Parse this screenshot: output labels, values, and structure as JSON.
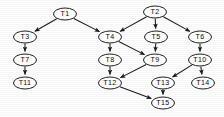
{
  "diagram": {
    "type": "directed-acyclic-graph",
    "background_color": "#fdfdfd",
    "node_fill_color": "#ffffff",
    "node_stroke_color": "#161616",
    "edge_color": "#1c1c1c",
    "label_color": "#0d0d0d",
    "node_shape": "ellipse",
    "node_rx": 11.5,
    "node_ry": 6.0,
    "nodes": [
      {
        "id": "T1",
        "label": "T1",
        "x": 65,
        "y": 14
      },
      {
        "id": "T2",
        "label": "T2",
        "x": 155,
        "y": 12
      },
      {
        "id": "T3",
        "label": "T3",
        "x": 25,
        "y": 37
      },
      {
        "id": "T4",
        "label": "T4",
        "x": 110,
        "y": 37
      },
      {
        "id": "T5",
        "label": "T5",
        "x": 156,
        "y": 37
      },
      {
        "id": "T6",
        "label": "T6",
        "x": 200,
        "y": 37
      },
      {
        "id": "T7",
        "label": "T7",
        "x": 25,
        "y": 60
      },
      {
        "id": "T8",
        "label": "T8",
        "x": 110,
        "y": 60
      },
      {
        "id": "T9",
        "label": "T9",
        "x": 155,
        "y": 60
      },
      {
        "id": "T10",
        "label": "T10",
        "x": 200,
        "y": 60
      },
      {
        "id": "T11",
        "label": "T11",
        "x": 25,
        "y": 83
      },
      {
        "id": "T12",
        "label": "T12",
        "x": 110,
        "y": 83
      },
      {
        "id": "T13",
        "label": "T13",
        "x": 163,
        "y": 83
      },
      {
        "id": "T14",
        "label": "T14",
        "x": 203,
        "y": 83
      },
      {
        "id": "T15",
        "label": "T15",
        "x": 163,
        "y": 103
      }
    ],
    "edges": [
      {
        "from": "T1",
        "to": "T3"
      },
      {
        "from": "T1",
        "to": "T4"
      },
      {
        "from": "T2",
        "to": "T4"
      },
      {
        "from": "T2",
        "to": "T5"
      },
      {
        "from": "T2",
        "to": "T6"
      },
      {
        "from": "T3",
        "to": "T7"
      },
      {
        "from": "T7",
        "to": "T11"
      },
      {
        "from": "T4",
        "to": "T8"
      },
      {
        "from": "T4",
        "to": "T9"
      },
      {
        "from": "T5",
        "to": "T9"
      },
      {
        "from": "T6",
        "to": "T10"
      },
      {
        "from": "T8",
        "to": "T12"
      },
      {
        "from": "T9",
        "to": "T12"
      },
      {
        "from": "T10",
        "to": "T13"
      },
      {
        "from": "T10",
        "to": "T14"
      },
      {
        "from": "T12",
        "to": "T15"
      },
      {
        "from": "T13",
        "to": "T15"
      }
    ]
  }
}
